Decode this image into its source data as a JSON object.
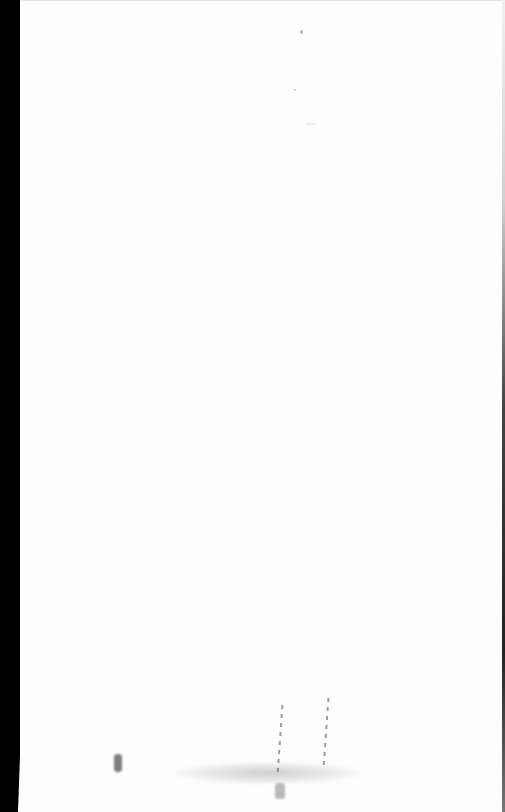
{
  "document": {
    "type": "scanned-page",
    "text_content": "",
    "background_color": "#fdfdfd",
    "scan_edge_left_color": "#000000",
    "scan_edge_right_color": "#222222",
    "artifacts": [
      {
        "name": "speck-top",
        "x": 301,
        "y": 31
      },
      {
        "name": "speck-upper",
        "x": 295,
        "y": 90
      },
      {
        "name": "speck-faint",
        "x": 310,
        "y": 124
      },
      {
        "name": "smudge-left-mark",
        "x": 117,
        "y": 763
      },
      {
        "name": "smudge-band",
        "x": 175,
        "y": 762
      },
      {
        "name": "streak-1",
        "x": 279,
        "y": 705
      },
      {
        "name": "streak-2",
        "x": 325,
        "y": 700
      },
      {
        "name": "smudge-bottom",
        "x": 279,
        "y": 790
      }
    ]
  }
}
